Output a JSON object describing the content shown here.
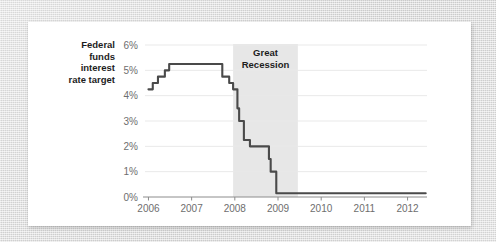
{
  "figure": {
    "background_color": "#d8d8d8",
    "card_color": "#ffffff"
  },
  "chart_data": {
    "type": "line",
    "title": "",
    "subtitle": "",
    "xlabel": "",
    "ylabel": "",
    "grid": true,
    "legend_position": "inline-left",
    "line_color": "#4a4a4a",
    "gridline_color": "#e9e9e9",
    "axis_color": "#8c8c8c",
    "tick_label_color": "#6e6e6e",
    "xlim": [
      2005.92,
      2012.45
    ],
    "ylim": [
      0,
      6
    ],
    "xticks": [
      2006,
      2007,
      2008,
      2009,
      2010,
      2011,
      2012
    ],
    "xtick_labels": [
      "2006",
      "2007",
      "2008",
      "2009",
      "2010",
      "2011",
      "2012"
    ],
    "yticks": [
      0,
      1,
      2,
      3,
      4,
      5,
      6
    ],
    "ytick_labels": [
      "0%",
      "1%",
      "2%",
      "3%",
      "4%",
      "5%",
      "6%"
    ],
    "series": [
      {
        "name": "Federal funds interest rate target",
        "label_lines": [
          "Federal",
          "funds",
          "interest",
          "rate target"
        ],
        "color": "#4a4a4a",
        "step": "post",
        "points": [
          {
            "x": 2006.0,
            "y": 4.25
          },
          {
            "x": 2006.1,
            "y": 4.5
          },
          {
            "x": 2006.22,
            "y": 4.75
          },
          {
            "x": 2006.33,
            "y": 4.75
          },
          {
            "x": 2006.38,
            "y": 5.0
          },
          {
            "x": 2006.48,
            "y": 5.25
          },
          {
            "x": 2007.6,
            "y": 5.25
          },
          {
            "x": 2007.71,
            "y": 4.75
          },
          {
            "x": 2007.87,
            "y": 4.5
          },
          {
            "x": 2007.96,
            "y": 4.25
          },
          {
            "x": 2008.06,
            "y": 3.5
          },
          {
            "x": 2008.1,
            "y": 3.0
          },
          {
            "x": 2008.21,
            "y": 2.25
          },
          {
            "x": 2008.35,
            "y": 2.0
          },
          {
            "x": 2008.77,
            "y": 2.0
          },
          {
            "x": 2008.79,
            "y": 1.5
          },
          {
            "x": 2008.83,
            "y": 1.0
          },
          {
            "x": 2008.96,
            "y": 0.15
          },
          {
            "x": 2012.42,
            "y": 0.15
          }
        ]
      }
    ],
    "annotations": [
      {
        "name": "great-recession-band",
        "type": "vspan",
        "label_lines": [
          "Great",
          "Recession"
        ],
        "x_start": 2007.96,
        "x_end": 2009.46,
        "fill_color": "#e7e7e7"
      }
    ]
  }
}
